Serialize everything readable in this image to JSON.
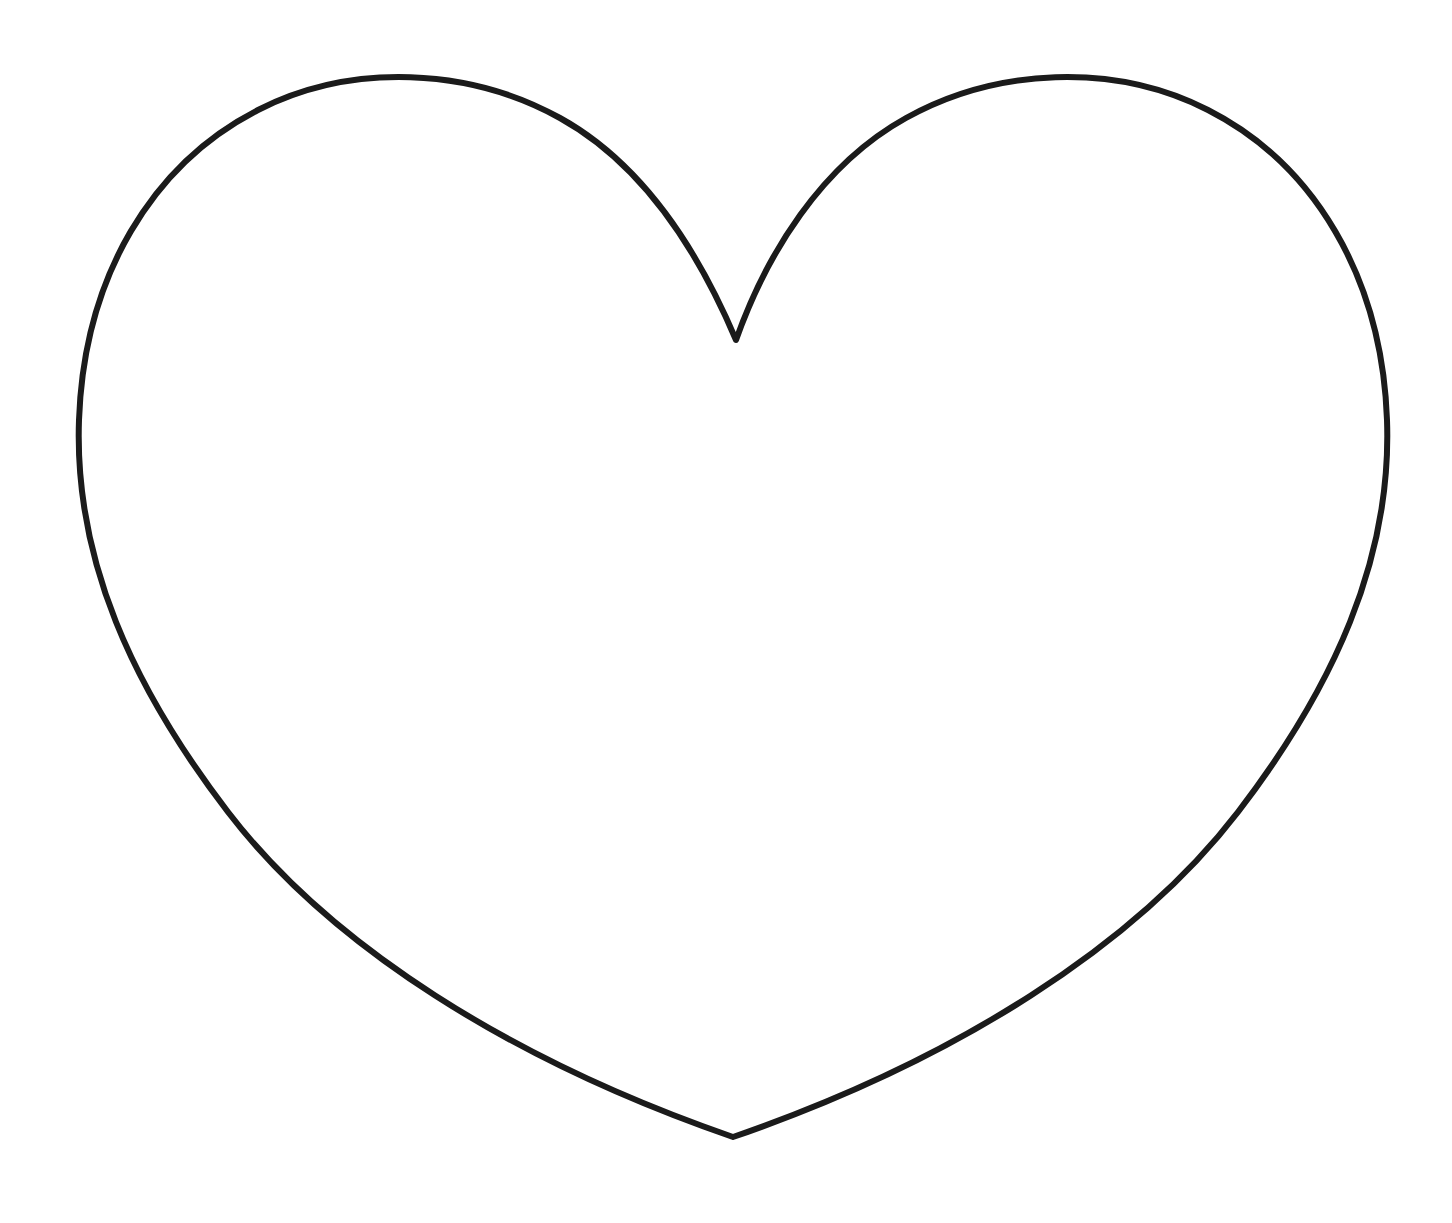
{
  "canvas": {
    "width": 1452,
    "height": 1223,
    "background_color": "#ffffff",
    "title": "Heart Outline Coloring Page"
  },
  "artwork": {
    "name": "heart-outline",
    "description": "Large symmetric heart drawn as a single closed black outline on a plain white background, unfilled",
    "stroke_color": "#1b1b1b",
    "fill_color": "none",
    "stroke_width": 6,
    "stroke_linecap": "round",
    "stroke_linejoin": "round",
    "geometry": {
      "top_cleft": {
        "x": 736,
        "y": 340
      },
      "left_lobe_apex": {
        "x": 390,
        "y": 87
      },
      "right_lobe_apex": {
        "x": 1070,
        "y": 88
      },
      "leftmost": {
        "x": 79,
        "y": 425
      },
      "rightmost": {
        "x": 1381,
        "y": 425
      },
      "bottom_tip": {
        "x": 733,
        "y": 1137
      },
      "center_x": 730,
      "width_px": 1302,
      "height_px": 1051
    },
    "path": "M 736 340 C 700 255 645 165 560 118 C 470 68 352 62 258 110 C 152 164 84 277 79 420 C 74 560 133 688 228 812 C 330 945 510 1060 733 1137 C 956 1060 1136 945 1238 812 C 1333 688 1392 560 1387 420 C 1382 277 1314 164 1208 110 C 1114 62 996 68 906 118 C 821 165 766 255 736 340 Z"
  }
}
